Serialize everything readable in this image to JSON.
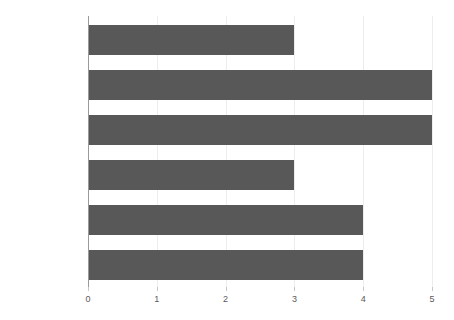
{
  "chart_data": {
    "type": "bar",
    "orientation": "horizontal",
    "title": "",
    "subtitle": "",
    "xlabel": "",
    "ylabel": "",
    "categories": [
      "Burning Fat",
      "Building Muscle",
      "Recovery",
      "Anti-Aging",
      "Side-Effects",
      "Cost"
    ],
    "values": [
      3,
      5,
      5,
      3,
      4,
      4
    ],
    "xlim": [
      0,
      5
    ],
    "xticks": [
      0,
      1,
      2,
      3,
      4,
      5
    ],
    "xtick_labels": [
      "0",
      "1",
      "2",
      "3",
      "4",
      "5"
    ],
    "grid": true,
    "grid_axis": "x",
    "legend": false,
    "legend_position": "none",
    "bar_color": "#585858",
    "background_color": "#ffffff",
    "gridline_color": "#ededed",
    "axis_color": "#9a9a9a",
    "label_color": "#4a4a4a"
  }
}
